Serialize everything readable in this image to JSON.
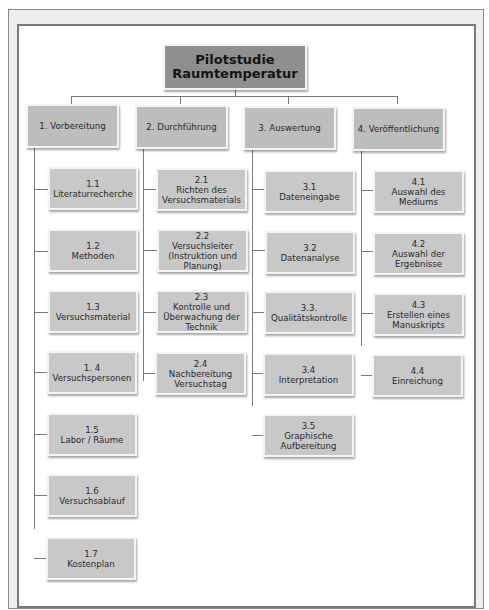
{
  "root": {
    "line1": "Pilotstudie",
    "line2": "Raumtemperatur"
  },
  "branches": [
    {
      "label": "1. Vorbereitung",
      "children": [
        {
          "num": "1.1",
          "l1": "Literaturrecherche",
          "l2": ""
        },
        {
          "num": "1.2",
          "l1": "Methoden",
          "l2": ""
        },
        {
          "num": "1.3",
          "l1": "Versuchsmaterial",
          "l2": ""
        },
        {
          "num": "1. 4",
          "l1": "Versuchspersonen",
          "l2": ""
        },
        {
          "num": "1.5",
          "l1": "Labor / Räume",
          "l2": ""
        },
        {
          "num": "1.6",
          "l1": "Versuchsablauf",
          "l2": ""
        },
        {
          "num": "1.7",
          "l1": "Kostenplan",
          "l2": ""
        }
      ]
    },
    {
      "label": "2. Durchführung",
      "children": [
        {
          "num": "2.1",
          "l1": "Richten des",
          "l2": "Versuchsmaterials"
        },
        {
          "num": "2.2",
          "l1": "Versuchsleiter",
          "l2": "(Instruktion und",
          "l3": "Planung)"
        },
        {
          "num": "2.3",
          "l1": "Kontrolle und",
          "l2": "Überwachung der",
          "l3": "Technik"
        },
        {
          "num": "2.4",
          "l1": "Nachbereitung",
          "l2": "Versuchstag"
        }
      ]
    },
    {
      "label": "3. Auswertung",
      "children": [
        {
          "num": "3.1",
          "l1": "Dateneingabe",
          "l2": ""
        },
        {
          "num": "3.2",
          "l1": "Datenanalyse",
          "l2": ""
        },
        {
          "num": "3.3.",
          "l1": "Qualitätskontrolle",
          "l2": ""
        },
        {
          "num": "3.4",
          "l1": "Interpretation",
          "l2": ""
        },
        {
          "num": "3.5",
          "l1": "Graphische",
          "l2": "Aufbereitung"
        }
      ]
    },
    {
      "label": "4. Veröffentlichung",
      "children": [
        {
          "num": "4.1",
          "l1": "Auswahl des",
          "l2": "Mediums"
        },
        {
          "num": "4.2",
          "l1": "Auswahl der",
          "l2": "Ergebnisse"
        },
        {
          "num": "4.3",
          "l1": "Erstellen eines",
          "l2": "Manuskripts"
        },
        {
          "num": "4.4",
          "l1": "Einreichung",
          "l2": ""
        }
      ]
    }
  ]
}
